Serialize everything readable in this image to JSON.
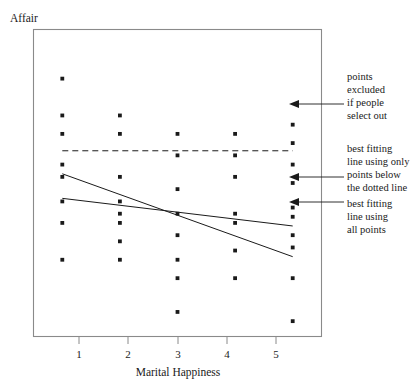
{
  "chart_data": {
    "type": "scatter",
    "title": "",
    "xlabel": "Marital Happiness",
    "ylabel": "Affair",
    "xlim": [
      0.5,
      5.5
    ],
    "ylim": [
      0,
      10
    ],
    "grid": false,
    "legend_position": "right-annotations",
    "xticks": [
      1,
      2,
      3,
      4,
      5
    ],
    "xticklabels": [
      "1",
      "2",
      "3",
      "4",
      "5"
    ],
    "yticklabels": [],
    "point_color": "#1a1a1a",
    "line_color": "#1a1a1a",
    "frame_color": "#8a8a8a",
    "series": [
      {
        "name": "observations",
        "points": [
          {
            "x": 1,
            "y": 8.4
          },
          {
            "x": 1,
            "y": 7.2
          },
          {
            "x": 1,
            "y": 6.6
          },
          {
            "x": 1,
            "y": 5.6
          },
          {
            "x": 1,
            "y": 5.2
          },
          {
            "x": 1,
            "y": 4.4
          },
          {
            "x": 1,
            "y": 3.7
          },
          {
            "x": 1,
            "y": 2.5
          },
          {
            "x": 2,
            "y": 7.2
          },
          {
            "x": 2,
            "y": 6.6
          },
          {
            "x": 2,
            "y": 5.2
          },
          {
            "x": 2,
            "y": 4.4
          },
          {
            "x": 2,
            "y": 4.0
          },
          {
            "x": 2,
            "y": 3.7
          },
          {
            "x": 2,
            "y": 3.1
          },
          {
            "x": 2,
            "y": 2.5
          },
          {
            "x": 3,
            "y": 6.6
          },
          {
            "x": 3,
            "y": 5.9
          },
          {
            "x": 3,
            "y": 4.8
          },
          {
            "x": 3,
            "y": 4.0
          },
          {
            "x": 3,
            "y": 3.3
          },
          {
            "x": 3,
            "y": 2.5
          },
          {
            "x": 3,
            "y": 1.9
          },
          {
            "x": 3,
            "y": 0.8
          },
          {
            "x": 4,
            "y": 6.6
          },
          {
            "x": 4,
            "y": 5.9
          },
          {
            "x": 4,
            "y": 5.2
          },
          {
            "x": 4,
            "y": 4.0
          },
          {
            "x": 4,
            "y": 3.7
          },
          {
            "x": 4,
            "y": 2.8
          },
          {
            "x": 4,
            "y": 1.9
          },
          {
            "x": 5,
            "y": 6.9
          },
          {
            "x": 5,
            "y": 6.3
          },
          {
            "x": 5,
            "y": 5.6
          },
          {
            "x": 5,
            "y": 5.0
          },
          {
            "x": 5,
            "y": 4.2
          },
          {
            "x": 5,
            "y": 3.9
          },
          {
            "x": 5,
            "y": 3.3
          },
          {
            "x": 5,
            "y": 2.9
          },
          {
            "x": 5,
            "y": 1.9
          },
          {
            "x": 5,
            "y": 0.5
          }
        ]
      }
    ],
    "lines": [
      {
        "name": "best-fit-all-points",
        "style": "solid",
        "x0": 1,
        "y0": 5.3,
        "x1": 5,
        "y1": 2.6
      },
      {
        "name": "best-fit-below-threshold",
        "style": "solid",
        "x0": 1,
        "y0": 4.5,
        "x1": 5,
        "y1": 3.6
      },
      {
        "name": "selection-threshold",
        "style": "dashed",
        "x0": 1,
        "y0": 6.05,
        "x1": 5,
        "y1": 6.05
      }
    ],
    "annotations": [
      {
        "id": "excluded-points",
        "lines": [
          "points",
          "excluded",
          "if people",
          "select out"
        ],
        "target_line": "selection-threshold"
      },
      {
        "id": "fit-below-threshold",
        "lines": [
          "best fitting",
          "line using only",
          "points below",
          "the dotted line"
        ],
        "target_line": "best-fit-below-threshold"
      },
      {
        "id": "fit-all-points",
        "lines": [
          "best fitting",
          "line using",
          "all points"
        ],
        "target_line": "best-fit-all-points"
      }
    ]
  }
}
